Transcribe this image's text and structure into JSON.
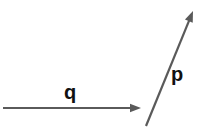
{
  "figure": {
    "kind": "vector-diagram",
    "background_color": "#ffffff",
    "stroke_color": "#5a5a5a",
    "label_color": "#111111",
    "width": 203,
    "height": 130
  },
  "vectors": [
    {
      "id": "q",
      "label": "q",
      "name": "vector-q",
      "orientation": "horizontal",
      "direction": "right",
      "start": {
        "x": 3,
        "y": 108
      },
      "end": {
        "x": 141,
        "y": 108
      },
      "stroke_width": 2.2,
      "arrowhead": "filled-triangle",
      "label_position": {
        "x": 64,
        "y": 82
      }
    },
    {
      "id": "p",
      "label": "p",
      "name": "vector-p",
      "orientation": "diagonal",
      "direction": "up-right",
      "start": {
        "x": 146,
        "y": 126
      },
      "end": {
        "x": 193,
        "y": 11
      },
      "stroke_width": 2.2,
      "arrowhead": "filled-triangle",
      "label_position": {
        "x": 171,
        "y": 64
      }
    }
  ],
  "labels": {
    "q_label": "q",
    "p_label": "p"
  }
}
